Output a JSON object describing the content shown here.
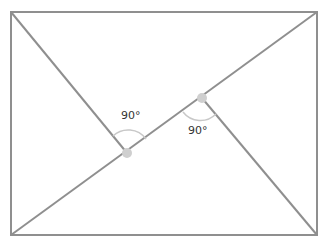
{
  "diagram": {
    "type": "rectangle-with-diagonal-and-perpendiculars",
    "colors": {
      "line": "#8f8f8f",
      "arc": "#c8c8c8",
      "point": "#cfcfcf",
      "text": "#333333"
    },
    "labels": {
      "angle_left": "90°",
      "angle_right": "90°"
    }
  }
}
